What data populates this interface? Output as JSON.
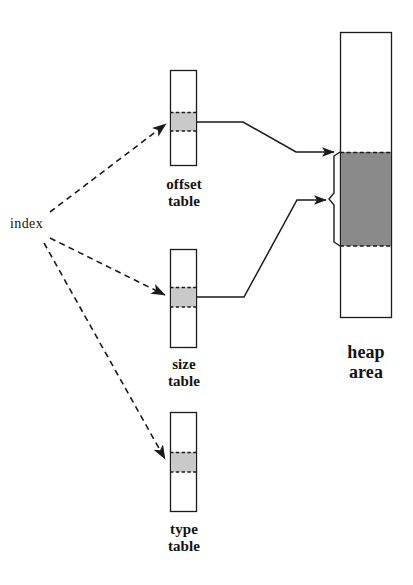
{
  "figure": {
    "type": "diagram",
    "title": "",
    "background_color": "#ffffff",
    "line_color": "#1a1a1a",
    "light_shade_color": "#c9c9c9",
    "dark_shade_color": "#8a8a8a"
  },
  "labels": {
    "index": "index",
    "offset_table": "offset\ntable",
    "size_table": "size\ntable",
    "type_table": "type\ntable",
    "heap_area": "heap\narea"
  },
  "nodes": [
    {
      "id": "offset-table",
      "label": "offset\ntable",
      "shape": "rectangle",
      "x": 170,
      "y": 70,
      "width": 27,
      "height": 96,
      "highlighted_cell": {
        "y": 112,
        "height": 19,
        "fill": "#c9c9c9",
        "border": "dashed"
      }
    },
    {
      "id": "size-table",
      "label": "size\ntable",
      "shape": "rectangle",
      "x": 170,
      "y": 249,
      "width": 27,
      "height": 99,
      "highlighted_cell": {
        "y": 287,
        "height": 20,
        "fill": "#c9c9c9",
        "border": "dashed"
      }
    },
    {
      "id": "type-table",
      "label": "type\ntable",
      "shape": "rectangle",
      "x": 170,
      "y": 412,
      "width": 27,
      "height": 100,
      "highlighted_cell": {
        "y": 452,
        "height": 20,
        "fill": "#c9c9c9",
        "border": "dashed"
      }
    },
    {
      "id": "heap-area",
      "label": "heap\narea",
      "shape": "rectangle",
      "x": 340,
      "y": 32,
      "width": 52,
      "height": 286,
      "highlighted_cell": {
        "y": 152,
        "height": 94,
        "fill": "#8a8a8a",
        "border": "dashed"
      }
    }
  ],
  "edges": [
    {
      "id": "index-to-offset",
      "from": "index",
      "to": "offset-table",
      "style": "dashed",
      "arrowhead": true
    },
    {
      "id": "index-to-size",
      "from": "index",
      "to": "size-table",
      "style": "dashed",
      "arrowhead": true
    },
    {
      "id": "index-to-type",
      "from": "index",
      "to": "type-table",
      "style": "dashed",
      "arrowhead": true
    },
    {
      "id": "offset-to-heap-start",
      "from": "offset-table",
      "to": "heap-area",
      "style": "solid",
      "arrowhead": true
    },
    {
      "id": "size-to-heap-extent",
      "from": "size-table",
      "to": "heap-area",
      "style": "solid",
      "arrowhead": true
    }
  ],
  "annotations": {
    "heap_extent_brace": {
      "description": "brace marking shaded heap block extent",
      "top": 152,
      "bottom": 246,
      "notch_y": 199
    }
  }
}
